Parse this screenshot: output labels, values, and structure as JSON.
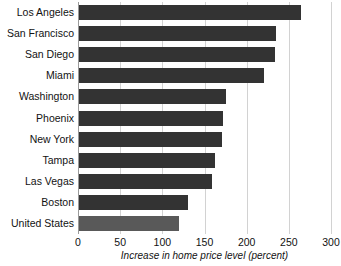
{
  "chart_data": {
    "type": "bar",
    "orientation": "horizontal",
    "title": "",
    "xlabel": "Increase in home price level (percent)",
    "ylabel": "",
    "xlim": [
      0,
      300
    ],
    "xticks": [
      0,
      50,
      100,
      150,
      200,
      250,
      300
    ],
    "grid": true,
    "legend": null,
    "categories": [
      "Los Angeles",
      "San Francisco",
      "San Diego",
      "Miami",
      "Washington",
      "Phoenix",
      "New York",
      "Tampa",
      "Las Vegas",
      "Boston",
      "United States"
    ],
    "values": [
      265,
      235,
      234,
      221,
      175,
      172,
      171,
      162,
      159,
      130,
      120
    ],
    "bar_colors": [
      "#333333",
      "#333333",
      "#333333",
      "#333333",
      "#333333",
      "#333333",
      "#333333",
      "#333333",
      "#333333",
      "#333333",
      "#595959"
    ]
  },
  "colors": {
    "bar_dark": "#333333",
    "bar_light": "#595959",
    "gridline": "#d2d2d2",
    "axis": "#9a9a9a",
    "text": "#121212",
    "background": "#ffffff"
  },
  "clipped_title": ""
}
